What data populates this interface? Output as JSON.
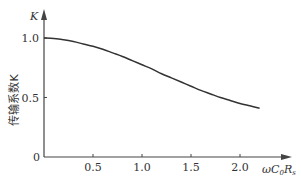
{
  "chart_data": {
    "type": "line",
    "title": "",
    "xlabel": "ωC₀Rₛ",
    "ylabel": "传输系数K",
    "y_axis_symbol": "K",
    "xlim": [
      0,
      2.3
    ],
    "ylim": [
      0,
      1.1
    ],
    "x_ticks": [
      0.5,
      1.0,
      1.5,
      2.0
    ],
    "x_tick_labels": [
      "0.5",
      "1.0",
      "1.5",
      "2.0"
    ],
    "y_ticks": [
      0,
      0.5,
      1.0
    ],
    "y_tick_labels": [
      "0",
      "0.5",
      "1.0"
    ],
    "grid": false,
    "legend": null,
    "series": [
      {
        "name": "K",
        "x": [
          0,
          0.1,
          0.2,
          0.3,
          0.4,
          0.5,
          0.6,
          0.7,
          0.8,
          0.9,
          1.0,
          1.1,
          1.2,
          1.3,
          1.4,
          1.5,
          1.6,
          1.7,
          1.8,
          1.9,
          2.0,
          2.1,
          2.2
        ],
        "values": [
          1.0,
          0.995,
          0.985,
          0.97,
          0.95,
          0.93,
          0.905,
          0.875,
          0.845,
          0.81,
          0.775,
          0.74,
          0.7,
          0.665,
          0.63,
          0.595,
          0.56,
          0.53,
          0.5,
          0.475,
          0.45,
          0.43,
          0.41
        ]
      }
    ]
  },
  "labels": {
    "origin": "0",
    "y_axis_symbol": "K",
    "y_axis_title": "传输系数K",
    "x_axis_title_omega": "ω",
    "x_axis_title_C": "C",
    "x_axis_title_C_sub": "0",
    "x_axis_title_R": "R",
    "x_axis_title_R_sub": "s"
  },
  "style": {
    "line_color": "#333333",
    "axis_color": "#444444",
    "background": "#ffffff"
  }
}
